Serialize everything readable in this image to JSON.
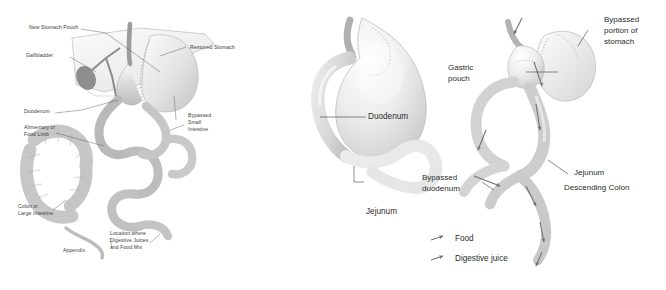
{
  "figure": {
    "style": "grayscale medical line-and-wash illustration",
    "panel_count": 3
  },
  "colors": {
    "background": "#ffffff",
    "ink": "#4a4a4a",
    "label_text": "#2b2b2b",
    "organ_light": "#f2f2f2",
    "organ_mid": "#d9d9d9",
    "organ_shadow": "#b4b4b4",
    "bypassed_pale": "#f6f6f6",
    "arrow": "#6e6e6e"
  },
  "panels": {
    "left": {
      "name": "post-bypass-overview",
      "labels": [
        {
          "id": "new-stomach-pouch",
          "text": "New Stomach Pouch"
        },
        {
          "id": "gallbladder",
          "text": "Gallbladder"
        },
        {
          "id": "duodenum",
          "text": "Duodenum"
        },
        {
          "id": "alimentary-limb",
          "text": "Alimentary or\nFood Limb"
        },
        {
          "id": "colon",
          "text": "Colon or\nLarge Intestine"
        },
        {
          "id": "appendix",
          "text": "Appendix"
        },
        {
          "id": "removed-stomach",
          "text": "Removed Stomach"
        },
        {
          "id": "bypassed-small-intestine",
          "text": "Bypassed\nSmall\nIntestine"
        },
        {
          "id": "mixing-point",
          "text": "Location where\nDigestive Juices\nand Food Mix"
        }
      ]
    },
    "middle": {
      "name": "normal-stomach-anatomy",
      "labels": [
        {
          "id": "duodenum",
          "text": "Duodenum"
        },
        {
          "id": "jejunum",
          "text": "Jejunum"
        }
      ]
    },
    "right": {
      "name": "bypass-flow-anatomy",
      "labels": [
        {
          "id": "bypassed-portion-of-stomach",
          "text": "Bypassed\nportion of\nstomach"
        },
        {
          "id": "gastric-pouch",
          "text": "Gastric\npouch"
        },
        {
          "id": "jejunum",
          "text": "Jejunum"
        },
        {
          "id": "bypassed-duodenum",
          "text": "Bypassed\nduodenum"
        },
        {
          "id": "descending-colon",
          "text": "Descending Colon"
        }
      ]
    }
  },
  "legend": {
    "name": "flow-legend",
    "items": [
      {
        "id": "food",
        "text": "Food",
        "marker": "arrow-icon"
      },
      {
        "id": "digestive-juice",
        "text": "Digestive juice",
        "marker": "arrow-icon"
      }
    ]
  }
}
